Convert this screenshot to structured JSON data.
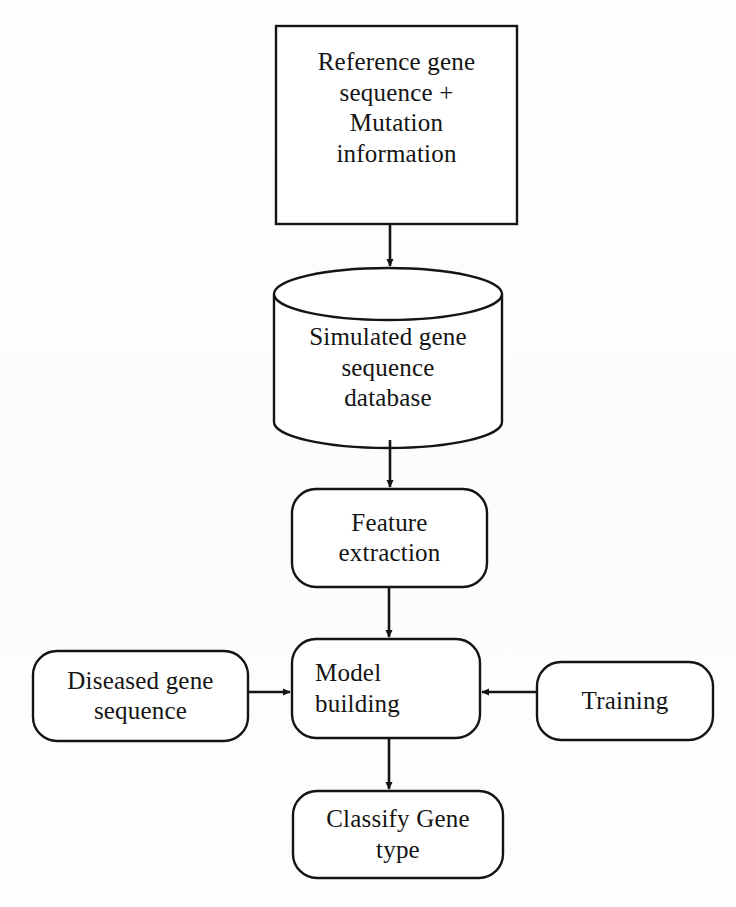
{
  "diagram": {
    "type": "flowchart",
    "background_color": "#fdfdfb",
    "stroke_color": "#141414",
    "text_color": "#141414",
    "nodes": [
      {
        "id": "reference-gene",
        "shape": "rectangle",
        "label": "Reference gene\nsequence +\nMutation\ninformation",
        "x": 276,
        "y": 26,
        "w": 241,
        "h": 198
      },
      {
        "id": "simulated-db",
        "shape": "cylinder",
        "label": "Simulated gene\nsequence\ndatabase",
        "x": 274,
        "y": 268,
        "w": 228,
        "h": 180
      },
      {
        "id": "feature-extraction",
        "shape": "rounded-rectangle",
        "label": "Feature\nextraction",
        "x": 292,
        "y": 489,
        "w": 195,
        "h": 98
      },
      {
        "id": "diseased-gene",
        "shape": "rounded-rectangle",
        "label": "Diseased gene\nsequence",
        "x": 33,
        "y": 651,
        "w": 215,
        "h": 90
      },
      {
        "id": "model-building",
        "shape": "rounded-rectangle",
        "label": "Model\nbuilding",
        "x": 292,
        "y": 639,
        "w": 188,
        "h": 99
      },
      {
        "id": "training",
        "shape": "rounded-rectangle",
        "label": "Training",
        "x": 537,
        "y": 662,
        "w": 176,
        "h": 78
      },
      {
        "id": "classify-gene",
        "shape": "rounded-rectangle",
        "label": "Classify Gene\ntype",
        "x": 293,
        "y": 791,
        "w": 210,
        "h": 87
      }
    ],
    "edges": [
      {
        "id": "edge-reference-to-database",
        "from": "reference-gene",
        "to": "simulated-db",
        "direction": "down"
      },
      {
        "id": "edge-database-to-feature",
        "from": "simulated-db",
        "to": "feature-extraction",
        "direction": "down"
      },
      {
        "id": "edge-feature-to-model",
        "from": "feature-extraction",
        "to": "model-building",
        "direction": "down"
      },
      {
        "id": "edge-diseased-to-model",
        "from": "diseased-gene",
        "to": "model-building",
        "direction": "right"
      },
      {
        "id": "edge-training-to-model",
        "from": "training",
        "to": "model-building",
        "direction": "left"
      },
      {
        "id": "edge-model-to-classify",
        "from": "model-building",
        "to": "classify-gene",
        "direction": "down"
      }
    ]
  }
}
